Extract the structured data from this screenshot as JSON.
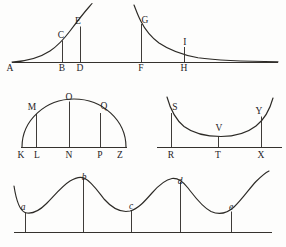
{
  "plate": {
    "title": "Geometrical figure plate",
    "background_color": "#fdfdfc",
    "ink_color": "#2c2a26",
    "width": 286,
    "height": 247
  },
  "figures": [
    {
      "id": "figure-1",
      "name": "paired-exponential-curves",
      "description": "Rising exponential curve on the left and decaying exponential curve on the right sharing one horizontal base line, with ordinates dropped to the axis.",
      "baseline_label": "AH",
      "labels": [
        {
          "text": "A",
          "role": "axis-origin",
          "x": 12,
          "y": 71
        },
        {
          "text": "C",
          "role": "curve-point",
          "x": 62,
          "y": 39
        },
        {
          "text": "B",
          "role": "foot-of-ordinate",
          "x": 62,
          "y": 71
        },
        {
          "text": "E",
          "role": "curve-point",
          "x": 79,
          "y": 25
        },
        {
          "text": "D",
          "role": "foot-of-ordinate",
          "x": 80,
          "y": 71
        },
        {
          "text": "G",
          "role": "curve-point",
          "x": 144,
          "y": 24
        },
        {
          "text": "F",
          "role": "foot-of-ordinate",
          "x": 141,
          "y": 71
        },
        {
          "text": "I",
          "role": "curve-point",
          "x": 185,
          "y": 46
        },
        {
          "text": "H",
          "role": "foot-of-ordinate",
          "x": 184,
          "y": 71
        }
      ]
    },
    {
      "id": "figure-2",
      "name": "semicircular-arc-with-ordinates",
      "description": "Semicircular arc standing on a base line with three ordinates drawn from arc to base.",
      "baseline_label": "KZ",
      "labels": [
        {
          "text": "M",
          "role": "curve-point",
          "x": 32,
          "y": 108
        },
        {
          "text": "O",
          "role": "curve-point",
          "x": 70,
          "y": 100
        },
        {
          "text": "Q",
          "role": "curve-point",
          "x": 101,
          "y": 108
        },
        {
          "text": "K",
          "role": "base-point",
          "x": 21,
          "y": 158
        },
        {
          "text": "L",
          "role": "foot-of-ordinate",
          "x": 36,
          "y": 158
        },
        {
          "text": "N",
          "role": "foot-of-ordinate",
          "x": 68,
          "y": 158
        },
        {
          "text": "P",
          "role": "foot-of-ordinate",
          "x": 99,
          "y": 158
        },
        {
          "text": "Z",
          "role": "base-point",
          "x": 119,
          "y": 158
        }
      ]
    },
    {
      "id": "figure-3",
      "name": "catenary-curve-with-ordinates",
      "description": "Upward opening catenary or parabola above a base line with three ordinates dropped to the base.",
      "baseline_label": "RX",
      "labels": [
        {
          "text": "S",
          "role": "curve-point",
          "x": 172,
          "y": 110
        },
        {
          "text": "V",
          "role": "curve-point",
          "x": 219,
          "y": 131
        },
        {
          "text": "Y",
          "role": "curve-point",
          "x": 261,
          "y": 115
        },
        {
          "text": "R",
          "role": "foot-of-ordinate",
          "x": 171,
          "y": 158
        },
        {
          "text": "T",
          "role": "foot-of-ordinate",
          "x": 217,
          "y": 158
        },
        {
          "text": "X",
          "role": "foot-of-ordinate",
          "x": 261,
          "y": 158
        }
      ]
    },
    {
      "id": "figure-4",
      "name": "undulating-wave-curve",
      "description": "Long sinusoidal wave of two and a half periods resting above a base line with five ordinates dropped at the crests and troughs.",
      "baseline_label": "base-line",
      "labels": [
        {
          "text": "a",
          "role": "trough-point",
          "x": 22,
          "y": 210
        },
        {
          "text": "b",
          "role": "crest-point",
          "x": 81,
          "y": 184
        },
        {
          "text": "c",
          "role": "trough-point",
          "x": 130,
          "y": 208
        },
        {
          "text": "d",
          "role": "crest-point",
          "x": 178,
          "y": 186
        },
        {
          "text": "e",
          "role": "trough-point",
          "x": 228,
          "y": 210
        }
      ]
    }
  ]
}
